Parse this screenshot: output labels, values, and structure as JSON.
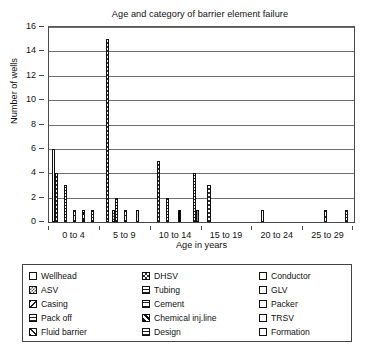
{
  "chart_data": {
    "type": "bar",
    "title": "Age and category of barrier element failure",
    "xlabel": "Age in years",
    "ylabel": "Number of wells",
    "ylim": [
      0,
      16
    ],
    "ytick_step": 2,
    "yticks": [
      "0",
      "2",
      "4",
      "6",
      "8",
      "10",
      "12",
      "14",
      "16"
    ],
    "grid": "horizontal",
    "legend_position": "below-plot",
    "legend_columns": 3,
    "categories": [
      "0 to 4",
      "5 to 9",
      "10 to 14",
      "15 to 19",
      "20 to 24",
      "25 to 29"
    ],
    "series": [
      {
        "name": "Wellhead",
        "pattern": "gray-light-square",
        "values": [
          6,
          0,
          0,
          0,
          0,
          0
        ]
      },
      {
        "name": "DHSV",
        "pattern": "checkerboard",
        "values": [
          4,
          15,
          5,
          3,
          0,
          0
        ]
      },
      {
        "name": "Conductor",
        "pattern": "empty-white",
        "values": [
          0,
          0,
          0,
          0,
          1,
          0
        ]
      },
      {
        "name": "ASV",
        "pattern": "checkerboard-fine",
        "values": [
          0,
          1,
          0,
          0,
          0,
          0
        ]
      },
      {
        "name": "Tubing",
        "pattern": "checker-open",
        "values": [
          3,
          2,
          2,
          0,
          0,
          0
        ]
      },
      {
        "name": "GLV",
        "pattern": "gray-dark-dots",
        "values": [
          0,
          0,
          0,
          0,
          0,
          0
        ]
      },
      {
        "name": "Casing",
        "pattern": "diagonal-back",
        "values": [
          0,
          0,
          0,
          0,
          0,
          1
        ]
      },
      {
        "name": "Cement",
        "pattern": "horizontal-wide",
        "values": [
          1,
          1,
          0,
          0,
          0,
          0
        ]
      },
      {
        "name": "Packer",
        "pattern": "solid-black",
        "values": [
          0,
          0,
          1,
          0,
          0,
          0
        ]
      },
      {
        "name": "Pack off",
        "pattern": "horizontal-lines",
        "values": [
          0,
          0,
          0,
          0,
          0,
          0
        ]
      },
      {
        "name": "Chemical inj.line",
        "pattern": "diagonal-thick-back",
        "values": [
          1,
          0,
          0,
          0,
          0,
          0
        ]
      },
      {
        "name": "TRSV",
        "pattern": "gray-light",
        "values": [
          0,
          1,
          0,
          0,
          0,
          0
        ]
      },
      {
        "name": "Fluid barrier",
        "pattern": "diagonal-thick-fwd",
        "values": [
          0,
          0,
          0,
          0,
          0,
          0
        ]
      },
      {
        "name": "Design",
        "pattern": "horizontal-dense",
        "values": [
          1,
          0,
          4,
          0,
          0,
          1
        ]
      },
      {
        "name": "Formation",
        "pattern": "gray-medium",
        "values": [
          0,
          0,
          1,
          0,
          0,
          0
        ]
      }
    ]
  },
  "legend": {
    "items": [
      {
        "label": "Wellhead",
        "swatch": "gray-light-square"
      },
      {
        "label": "DHSV",
        "swatch": "checkerboard"
      },
      {
        "label": "Conductor",
        "swatch": "empty-white"
      },
      {
        "label": "ASV",
        "swatch": "checkerboard-fine"
      },
      {
        "label": "Tubing",
        "swatch": "checker-open"
      },
      {
        "label": "GLV",
        "swatch": "gray-dark-dots"
      },
      {
        "label": "Casing",
        "swatch": "diagonal-back"
      },
      {
        "label": "Cement",
        "swatch": "horizontal-wide"
      },
      {
        "label": "Packer",
        "swatch": "solid-black"
      },
      {
        "label": "Pack off",
        "swatch": "horizontal-lines"
      },
      {
        "label": "Chemical inj.line",
        "swatch": "diagonal-thick-back"
      },
      {
        "label": "TRSV",
        "swatch": "gray-light"
      },
      {
        "label": "Fluid barrier",
        "swatch": "diagonal-thick-fwd"
      },
      {
        "label": "Design",
        "swatch": "horizontal-dense"
      },
      {
        "label": "Formation",
        "swatch": "gray-medium"
      }
    ]
  },
  "colors": {
    "axis": "#4a4a4a",
    "gridline": "#6f6f6f",
    "text": "#111111",
    "background": "#ffffff"
  }
}
